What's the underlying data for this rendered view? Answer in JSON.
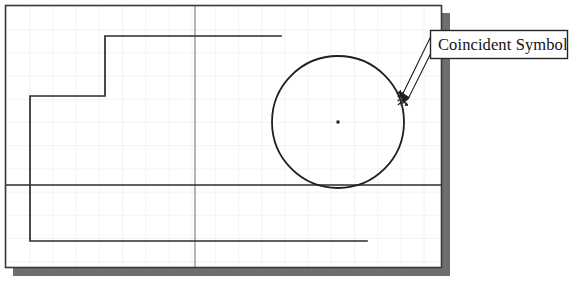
{
  "document": {
    "title": "Coincident Symbol Sketch",
    "background_color": "#ffffff"
  },
  "sketch_panel": {
    "name": "sketch-drawing-area",
    "frame": {
      "x": 5,
      "y": 5,
      "width": 437,
      "height": 263
    },
    "border_color": "#3a3a3a",
    "fill_color": "#ffffff",
    "shadow": {
      "color": "#6b6b6b",
      "offset_x": 8,
      "offset_y": 8
    },
    "grid": {
      "visible": true,
      "spacing": 23.2,
      "minor_color": "#e9e9ec",
      "major_color": "#7d7d82",
      "major_vertical_x": 195,
      "major_horizontal_y": 185
    }
  },
  "geometry": {
    "line_color": "#2b2b2b",
    "line_width": 1.6,
    "profile_label": "stepped-profile",
    "profile_points": [
      [
        281,
        36
      ],
      [
        105,
        36
      ],
      [
        105,
        96
      ],
      [
        30,
        96
      ],
      [
        30,
        241
      ],
      [
        367,
        241
      ]
    ],
    "horizontal_datum_line": {
      "x1": 6,
      "y1": 185,
      "x2": 441,
      "y2": 185
    },
    "circle": {
      "label": "sketch-circle",
      "center_x": 338,
      "center_y": 122,
      "radius": 66,
      "center_dot_size": 3,
      "center_dot_color": "#1a1a1a"
    }
  },
  "annotation": {
    "callout": {
      "label": "Coincident Symbol",
      "box": {
        "x": 430,
        "y": 30,
        "width": 137,
        "height": 28
      },
      "border_color": "#2a2a2a",
      "fill_color": "#ffffff",
      "text_color": "#121212"
    },
    "leader": {
      "label": "leader-arrow",
      "from_x": 430,
      "from_y": 46,
      "tip_x": 400,
      "tip_y": 97,
      "color": "#1c1c1c"
    },
    "symbol": {
      "label": "coincident-constraint-glyph",
      "x": 396,
      "y": 92,
      "color": "#1a1a1a",
      "description": "coincident constraint marker on circle edge"
    }
  }
}
